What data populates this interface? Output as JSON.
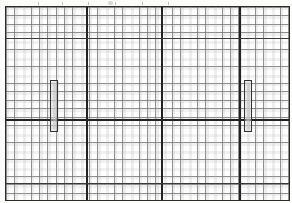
{
  "document": {
    "type": "gridded-elevation-drawing",
    "title": "",
    "description": "Scanned graph-paper elevation grid with two narrow vertical elements",
    "canvas": {
      "width": 292,
      "height": 203
    },
    "ink_color": "#222222",
    "grid_color": "#2b2b2b",
    "paper_color": "#ffffff"
  },
  "frame": {
    "name": "drawing-border",
    "left": 5,
    "top": 6,
    "width": 285,
    "height": 195,
    "stroke_width": 1.5
  },
  "grid": {
    "minor_cell_width_px": 8.3,
    "minor_cell_height_px": 8.45,
    "minor_columns": 34,
    "minor_rows": 23,
    "banded": true,
    "band_color": "#aaaaaa"
  },
  "major_lines": {
    "vertical": [
      {
        "name": "major-vertical-1",
        "x": 80
      },
      {
        "name": "major-vertical-2",
        "x": 155
      },
      {
        "name": "major-vertical-3",
        "x": 233
      }
    ],
    "horizontal": [
      {
        "name": "major-horizontal-1",
        "y": 112,
        "weight": "heavy"
      }
    ],
    "semi_horizontal": [
      {
        "name": "semi-horizontal-1",
        "y": 31,
        "weight": "medium"
      },
      {
        "name": "semi-horizontal-2",
        "y": 176,
        "weight": "medium"
      }
    ]
  },
  "elements": [
    {
      "name": "vertical-element-left",
      "label": "left vertical member",
      "x": 44,
      "y": 73,
      "width": 8,
      "height": 52
    },
    {
      "name": "vertical-element-right",
      "label": "right vertical member",
      "x": 238,
      "y": 73,
      "width": 8,
      "height": 52
    }
  ],
  "top_marks": {
    "smudge_x": 108,
    "smudge_y": 1,
    "tick_positions": [
      38,
      62,
      88,
      115,
      142,
      168
    ]
  }
}
